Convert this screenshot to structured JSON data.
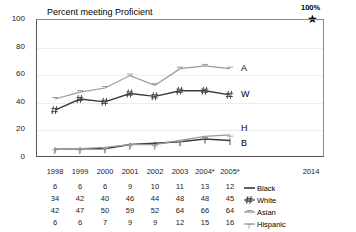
{
  "chart_data": {
    "type": "line",
    "title": "Percent meeting Proficient",
    "xlabel": "",
    "ylabel": "",
    "ylim": [
      0,
      100
    ],
    "yticks": [
      0,
      20,
      40,
      60,
      80,
      100
    ],
    "grid": true,
    "legend_position": "right-of-table",
    "categories": [
      "1998",
      "1999",
      "2000",
      "2001",
      "2002",
      "2003",
      "2004*",
      "2005*"
    ],
    "future_tick": "2014",
    "series": [
      {
        "name": "Black",
        "short": "B",
        "values": [
          6,
          6,
          6,
          9,
          10,
          11,
          13,
          12
        ]
      },
      {
        "name": "White",
        "short": "W",
        "values": [
          34,
          42,
          40,
          46,
          44,
          48,
          48,
          45
        ]
      },
      {
        "name": "Asian",
        "short": "A",
        "values": [
          42,
          47,
          50,
          59,
          52,
          64,
          66,
          64
        ]
      },
      {
        "name": "Hispanic",
        "short": "H",
        "values": [
          6,
          6,
          7,
          9,
          9,
          12,
          15,
          16
        ]
      }
    ],
    "annotations": [
      {
        "label": "100%",
        "value": 100,
        "at": "2014",
        "marker": "star"
      }
    ]
  },
  "axis": {
    "yticks": [
      "100",
      "80",
      "60",
      "40",
      "20",
      "0"
    ]
  },
  "legend": {
    "items": [
      {
        "label": "Black",
        "marker": "dash-dark"
      },
      {
        "label": "White",
        "marker": "hash"
      },
      {
        "label": "Asian",
        "marker": "dash-light"
      },
      {
        "label": "Hispanic",
        "marker": "tee"
      }
    ]
  },
  "end_labels": {
    "asian": "A",
    "white": "W",
    "hispanic": "H",
    "black": "B"
  },
  "star": {
    "label": "100%",
    "glyph": "★"
  },
  "colors": {
    "dark_line": "#3a3a3a",
    "light_line": "#9a9a9a",
    "grid": "#ededed",
    "axis": "#555555",
    "text": "#222222"
  }
}
